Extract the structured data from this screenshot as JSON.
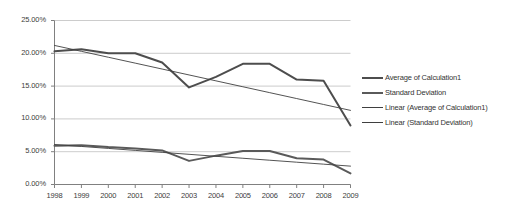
{
  "chart_data": {
    "type": "line",
    "title": "",
    "xlabel": "",
    "ylabel": "",
    "grid": true,
    "legend_position": "right",
    "ylim": [
      0,
      25
    ],
    "ytick_labels": [
      "25.00%",
      "20.00%",
      "15.00%",
      "10.00%",
      "5.00%",
      "0.00%"
    ],
    "ytick_values": [
      25,
      20,
      15,
      10,
      5,
      0
    ],
    "categories": [
      "1998",
      "1999",
      "2000",
      "2001",
      "2002",
      "2003",
      "2004",
      "2005",
      "2006",
      "2007",
      "2008",
      "2009"
    ],
    "series": [
      {
        "name": "Average of Calculation1",
        "kind": "data",
        "color": "#4d4d4d",
        "width": 2.0,
        "values": [
          20.3,
          20.6,
          20.0,
          20.0,
          18.6,
          14.8,
          16.4,
          18.4,
          18.4,
          16.0,
          15.8,
          9.0
        ]
      },
      {
        "name": "Standard Deviation",
        "kind": "data",
        "color": "#5a5a5a",
        "width": 2.0,
        "values": [
          5.9,
          6.0,
          5.7,
          5.5,
          5.2,
          3.6,
          4.4,
          5.1,
          5.1,
          4.0,
          3.8,
          1.7
        ]
      },
      {
        "name": "Linear (Average of Calculation1)",
        "kind": "trend",
        "color": "#3f3f3f",
        "width": 0.9,
        "values": [
          21.2,
          20.3,
          19.4,
          18.5,
          17.6,
          16.7,
          15.8,
          14.9,
          14.0,
          13.1,
          12.2,
          11.3
        ]
      },
      {
        "name": "Linear (Standard Deviation)",
        "kind": "trend",
        "color": "#3f3f3f",
        "width": 0.9,
        "values": [
          6.1,
          5.8,
          5.5,
          5.2,
          4.9,
          4.6,
          4.3,
          4.0,
          3.7,
          3.4,
          3.1,
          2.8
        ]
      }
    ]
  },
  "axis": {
    "axis_color": "#808080",
    "grid_color": "#bfbfbf"
  }
}
